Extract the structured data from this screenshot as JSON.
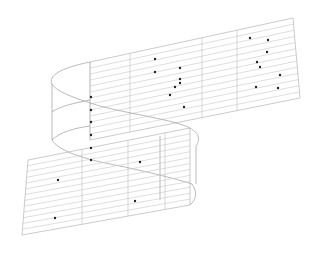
{
  "diagram": {
    "title": "",
    "colors": {
      "background": "#ffffff",
      "lines": "#c8c8c8",
      "dots": "#222222"
    },
    "upper_panel": {
      "top_left": [
        90,
        62
      ],
      "top_right": [
        293,
        18
      ],
      "bottom_left": [
        90,
        140
      ],
      "bottom_right": [
        300,
        98
      ],
      "stripe_count": 13,
      "dividers_x": [
        90,
        130,
        202,
        237
      ]
    },
    "lower_panel": {
      "top_left": [
        28,
        160
      ],
      "top_right": [
        190,
        128
      ],
      "bottom_left": [
        22,
        235
      ],
      "bottom_right": [
        190,
        205
      ],
      "stripe_count": 13,
      "dividers_x": [
        82,
        128,
        165
      ]
    },
    "dots": [
      [
        250,
        38
      ],
      [
        268,
        40
      ],
      [
        267,
        52
      ],
      [
        257,
        62
      ],
      [
        260,
        67
      ],
      [
        155,
        59
      ],
      [
        155,
        72
      ],
      [
        180,
        68
      ],
      [
        180,
        79
      ],
      [
        175,
        87
      ],
      [
        180,
        83
      ],
      [
        170,
        95
      ],
      [
        184,
        107
      ],
      [
        280,
        75
      ],
      [
        256,
        87
      ],
      [
        278,
        88
      ],
      [
        91,
        97
      ],
      [
        91,
        110
      ],
      [
        91,
        122
      ],
      [
        91,
        135
      ],
      [
        91,
        148
      ],
      [
        91,
        160
      ],
      [
        140,
        162
      ],
      [
        58,
        180
      ],
      [
        135,
        201
      ],
      [
        55,
        218
      ]
    ]
  }
}
